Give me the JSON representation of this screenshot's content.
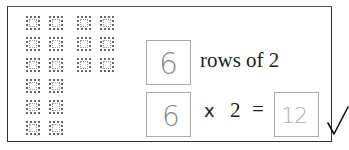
{
  "array_model": {
    "left_group": {
      "rows": 6,
      "cols": 2
    },
    "right_group": {
      "rows": 3,
      "cols": 2
    }
  },
  "sentence": {
    "rows_answer": "6",
    "rows_text": "rows of 2"
  },
  "equation": {
    "factor_answer": "6",
    "multiply_sign": "x",
    "factor": "2",
    "equals_sign": "=",
    "product_answer": "12"
  },
  "mark": {
    "icon": "checkmark-icon"
  }
}
